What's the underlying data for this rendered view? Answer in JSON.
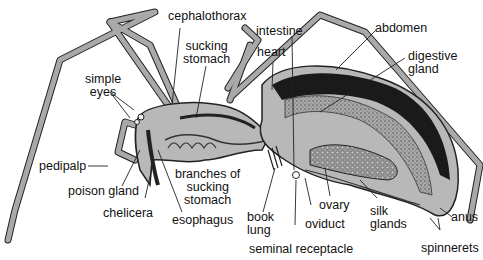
{
  "diagram": {
    "colors": {
      "leg_fill": "#a9a9a9",
      "body_fill": "#b8b8b8",
      "dark_region": "#1a1a1a",
      "gland_texture": "#8a8a8a",
      "outline": "#222222",
      "background": "#ffffff"
    },
    "labels": {
      "cephalothorax": "cephalothorax",
      "sucking_stomach": "sucking\nstomach",
      "simple_eyes": "simple\neyes",
      "pedipalp": "pedipalp",
      "poison_gland": "poison gland",
      "chelicera": "chelicera",
      "esophagus": "esophagus",
      "branches_of_sucking_stomach": "branches of\nsucking\nstomach",
      "intestine": "intestine",
      "heart": "heart",
      "abdomen": "abdomen",
      "digestive_gland": "digestive\ngland",
      "book_lung": "book\nlung",
      "oviduct": "oviduct",
      "seminal_receptacle": "seminal receptacle",
      "ovary": "ovary",
      "silk_glands": "silk\nglands",
      "anus": "anus",
      "spinnerets": "spinnerets"
    }
  }
}
